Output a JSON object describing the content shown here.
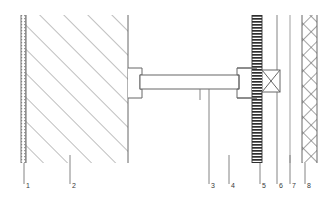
{
  "drawing": {
    "title": "Wall Assembly Section Detail",
    "type": "architectural-section-detail",
    "background_color": "#ffffff",
    "line_color": "#555555",
    "hatch_color": "#777777",
    "text_color": "#3a3a3a",
    "canvas": {
      "width": 327,
      "height": 201
    },
    "assembly_top_y": 15,
    "assembly_bottom_y": 163,
    "label_baseline_y": 188
  },
  "components": [
    {
      "id": 1,
      "label": "1",
      "name": "finish-layer",
      "hatch": "stipple",
      "x": 21,
      "width": 5,
      "top": 15,
      "bottom": 163,
      "leader_x": 24,
      "leader_top": 163,
      "leader_bottom": 184,
      "label_x": 26,
      "label_y": 182
    },
    {
      "id": 2,
      "label": "2",
      "name": "masonry-wall",
      "hatch": "diagonal",
      "x": 26,
      "width": 102,
      "top": 15,
      "bottom": 163,
      "leader_x": 70,
      "leader_top": 155,
      "leader_bottom": 184,
      "label_x": 72,
      "label_y": 182
    },
    {
      "id": 3,
      "label": "3",
      "name": "support-beam",
      "hatch": "none",
      "x": 140,
      "width": 99,
      "top": 75,
      "bottom": 89,
      "leader_x": 209,
      "leader_top": 89,
      "leader_bottom": 184,
      "label_x": 211,
      "label_y": 182
    },
    {
      "id": 4,
      "label": "4",
      "name": "bracket-fixing",
      "hatch": "none",
      "x": 229,
      "width": 2,
      "top": 155,
      "bottom": 163,
      "leader_x": 229,
      "leader_top": 155,
      "leader_bottom": 184,
      "label_x": 231,
      "label_y": 182
    },
    {
      "id": 5,
      "label": "5",
      "name": "ribbed-panel",
      "hatch": "horizontal-dense",
      "x": 252,
      "width": 10,
      "top": 15,
      "bottom": 163,
      "leader_x": 260,
      "leader_top": 163,
      "leader_bottom": 184,
      "label_x": 262,
      "label_y": 182
    },
    {
      "id": 6,
      "label": "6",
      "name": "anchor-plate-edge",
      "hatch": "none",
      "x": 277,
      "width": 1,
      "top": 90,
      "bottom": 155,
      "leader_x": 277,
      "leader_top": 90,
      "leader_bottom": 184,
      "label_x": 279,
      "label_y": 182
    },
    {
      "id": 7,
      "label": "7",
      "name": "air-cavity-line",
      "hatch": "none",
      "x": 290,
      "width": 1,
      "top": 155,
      "bottom": 163,
      "leader_x": 290,
      "leader_top": 155,
      "leader_bottom": 184,
      "label_x": 292,
      "label_y": 182
    },
    {
      "id": 8,
      "label": "8",
      "name": "insulation-panel",
      "hatch": "cross-diagonal",
      "x": 302,
      "width": 15,
      "top": 15,
      "bottom": 163,
      "leader_x": 305,
      "leader_top": 163,
      "leader_bottom": 184,
      "label_x": 307,
      "label_y": 182
    }
  ],
  "beam": {
    "name": "horizontal-steel-beam",
    "left_x": 140,
    "right_x": 239,
    "top_y": 75,
    "bottom_y": 89,
    "left_bracket": {
      "x": 128,
      "y": 68,
      "width": 14,
      "height": 30
    },
    "right_bracket": {
      "x": 237,
      "y": 68,
      "width": 20,
      "height": 30
    },
    "tick_x": 200,
    "tick_top": 89,
    "tick_bottom": 100
  },
  "x_detail": {
    "name": "cross-braced-connector",
    "x": 262,
    "y": 70,
    "width": 18,
    "height": 22
  }
}
